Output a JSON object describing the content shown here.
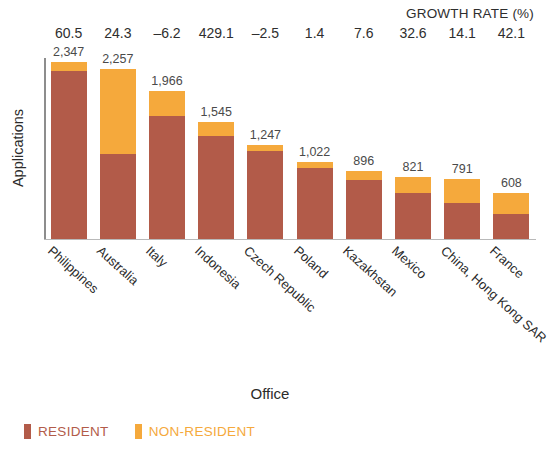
{
  "header": {
    "growth_rate_title": "GROWTH RATE (%)"
  },
  "axes": {
    "y_title": "Applications",
    "x_title": "Office"
  },
  "legend": {
    "items": [
      {
        "label": "RESIDENT",
        "color": "#B25B49"
      },
      {
        "label": "NON-RESIDENT",
        "color": "#F5A93C"
      }
    ]
  },
  "colors": {
    "resident": "#B25B49",
    "non_resident": "#F5A93C",
    "axis": "#8d8d8d",
    "text": "#2b2b2b"
  },
  "chart_data": {
    "type": "bar",
    "subtype": "stacked-column",
    "title": "",
    "xlabel": "Office",
    "ylabel": "Applications",
    "ylim": [
      0,
      2400
    ],
    "grid": false,
    "legend_position": "bottom-left",
    "categories": [
      "Philippines",
      "Australia",
      "Italy",
      "Indonesia",
      "Czech Republic",
      "Poland",
      "Kazakhstan",
      "Mexico",
      "China, Hong Kong SAR",
      "France"
    ],
    "totals": [
      2347,
      2257,
      1966,
      1545,
      1247,
      1022,
      896,
      821,
      791,
      608
    ],
    "total_labels": [
      "2,347",
      "2,257",
      "1,966",
      "1,545",
      "1,247",
      "1,022",
      "896",
      "821",
      "791",
      "608"
    ],
    "growth_rate_labels": [
      "60.5",
      "24.3",
      "–6.2",
      "429.1",
      "–2.5",
      "1.4",
      "7.6",
      "32.6",
      "14.1",
      "42.1"
    ],
    "growth_rate_values": [
      60.5,
      24.3,
      -6.2,
      429.1,
      -2.5,
      1.4,
      7.6,
      32.6,
      14.1,
      42.1
    ],
    "series": [
      {
        "name": "RESIDENT",
        "color": "#B25B49",
        "values": [
          2230,
          1130,
          1630,
          1360,
          1172,
          940,
          780,
          616,
          475,
          334
        ]
      },
      {
        "name": "NON-RESIDENT",
        "color": "#F5A93C",
        "values": [
          117,
          1127,
          336,
          185,
          75,
          82,
          116,
          205,
          316,
          274
        ]
      }
    ]
  }
}
